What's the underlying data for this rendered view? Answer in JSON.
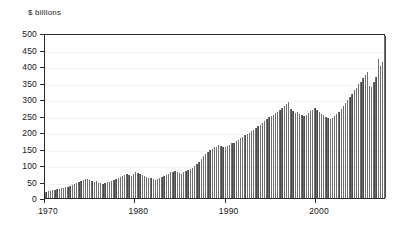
{
  "chart_data": {
    "type": "bar",
    "title": "",
    "subtitle": "",
    "unit_label": "$ billions",
    "xlabel": "",
    "ylabel": "$ billions",
    "ylim": [
      0,
      500
    ],
    "xlim": [
      1970,
      2007.75
    ],
    "grid": true,
    "legend": null,
    "frequency": "quarterly",
    "y_ticks": [
      0,
      50,
      100,
      150,
      200,
      250,
      300,
      350,
      400,
      450,
      500
    ],
    "y_tick_labels": [
      "0",
      "50",
      "100",
      "150",
      "200",
      "250",
      "300",
      "350",
      "400",
      "450",
      "500"
    ],
    "x_ticks": [
      1970,
      1980,
      1990,
      2000
    ],
    "x_tick_labels": [
      "1970",
      "1980",
      "1990",
      "2000"
    ],
    "bar_color": "#4a4a4a",
    "axis_color": "#2b2b2b",
    "grid_color": "#f2f2f2",
    "background_color": "#ffffff",
    "x_start": 1970,
    "x_step": 0.25,
    "values": [
      18,
      20,
      21,
      24,
      25,
      26,
      27,
      29,
      30,
      33,
      34,
      36,
      38,
      42,
      45,
      48,
      52,
      56,
      57,
      58,
      54,
      52,
      50,
      53,
      46,
      44,
      42,
      45,
      48,
      50,
      52,
      55,
      58,
      62,
      64,
      66,
      70,
      72,
      70,
      68,
      74,
      78,
      76,
      72,
      70,
      68,
      64,
      62,
      60,
      58,
      56,
      58,
      60,
      64,
      66,
      70,
      74,
      78,
      80,
      82,
      78,
      76,
      74,
      78,
      82,
      86,
      88,
      92,
      98,
      104,
      110,
      118,
      126,
      134,
      140,
      146,
      150,
      154,
      156,
      160,
      158,
      156,
      154,
      158,
      162,
      166,
      168,
      172,
      176,
      182,
      186,
      190,
      194,
      198,
      202,
      206,
      212,
      218,
      222,
      228,
      234,
      240,
      244,
      248,
      252,
      258,
      262,
      268,
      272,
      280,
      286,
      292,
      270,
      264,
      258,
      262,
      256,
      252,
      248,
      252,
      258,
      264,
      268,
      274,
      268,
      262,
      256,
      252,
      246,
      242,
      238,
      242,
      248,
      256,
      262,
      270,
      278,
      288,
      296,
      306,
      316,
      326,
      334,
      344,
      352,
      364,
      372,
      382,
      340,
      336,
      352,
      368,
      420,
      400,
      412,
      490
    ]
  }
}
